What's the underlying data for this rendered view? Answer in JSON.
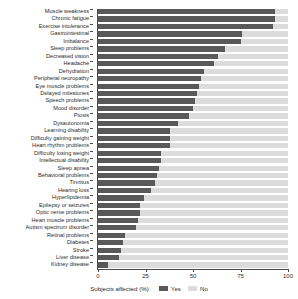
{
  "chart_data": {
    "type": "bar",
    "orientation": "horizontal",
    "stacked": true,
    "title": "",
    "xlabel": "Subjects affected (%)",
    "ylabel": "",
    "xlim": [
      0,
      100
    ],
    "xticks": [
      0,
      25,
      50,
      75,
      100
    ],
    "xticklabels": [
      "0",
      "25",
      "50",
      "75",
      "100"
    ],
    "grid": false,
    "legend": {
      "title": "Subjects affected (%)",
      "position": "bottom",
      "entries": [
        {
          "label": "Yes",
          "color": "#595959"
        },
        {
          "label": "No",
          "color": "#dcdcdc"
        }
      ]
    },
    "categories": [
      "Muscle weakness",
      "Chronic fatigue",
      "Exercise intolerance",
      "Gastrointestinal",
      "Imbalance",
      "Sleep problems",
      "Decreased vision",
      "Headache",
      "Dehydration",
      "Peripheral neuropathy",
      "Eye muscle problems",
      "Delayed milestones",
      "Speech problems",
      "Mood disorder",
      "Ptosis",
      "Dysautonomia",
      "Learning disability",
      "Difficulty gaining weight",
      "Heart rhythm problems",
      "Difficulty losing weight",
      "Intellectual disability",
      "Sleep apnea",
      "Behavioral problems",
      "Tinnitus",
      "Hearing loss",
      "Hyperlipidemia",
      "Epilepsy or seizures",
      "Optic nerve problems",
      "Heart muscle problems",
      "Autism spectrum disorder",
      "Retinal problems",
      "Diabetes",
      "Stroke",
      "Liver disease",
      "Kidney disease"
    ],
    "series": [
      {
        "name": "Yes",
        "color": "#595959",
        "values": [
          93,
          93,
          92,
          76,
          75,
          67,
          63,
          61,
          56,
          54,
          53,
          52,
          51,
          50,
          48,
          42,
          38,
          38,
          38,
          33,
          33,
          32,
          31,
          30,
          28,
          24,
          22,
          22,
          21,
          20,
          14,
          13,
          12,
          11,
          5
        ]
      },
      {
        "name": "No",
        "color": "#dcdcdc",
        "values": [
          7,
          7,
          8,
          24,
          25,
          33,
          37,
          39,
          44,
          46,
          47,
          48,
          49,
          50,
          52,
          58,
          62,
          62,
          62,
          67,
          67,
          68,
          69,
          70,
          72,
          76,
          78,
          78,
          79,
          80,
          86,
          87,
          88,
          89,
          95
        ]
      }
    ]
  }
}
